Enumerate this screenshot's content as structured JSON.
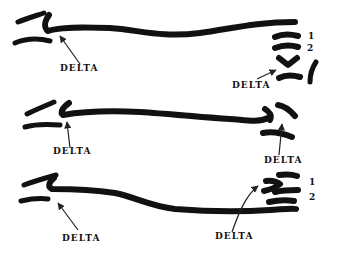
{
  "diagram": {
    "rows": [
      {
        "id": "row-1",
        "labels": {
          "left": "DELTA",
          "right": "DELTA"
        },
        "numbers": [
          "1",
          "2"
        ]
      },
      {
        "id": "row-2",
        "labels": {
          "left": "DELTA",
          "right": "DELTA"
        },
        "numbers": []
      },
      {
        "id": "row-3",
        "labels": {
          "left": "DELTA",
          "right": "DELTA"
        },
        "numbers": [
          "1",
          "2"
        ]
      }
    ],
    "ink_color": "#111111",
    "background": "#ffffff"
  }
}
